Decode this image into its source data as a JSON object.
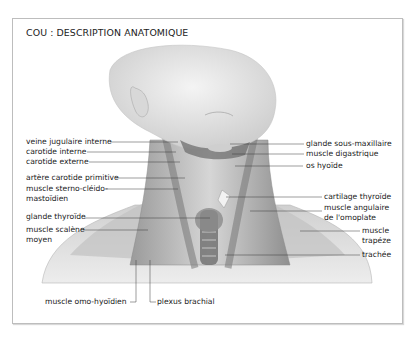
{
  "title": "COU : DESCRIPTION ANATOMIQUE",
  "labels_left": [
    {
      "id": "veine-jugulaire-interne",
      "text": "veine jugulaire interne"
    },
    {
      "id": "carotide-interne",
      "text": "carotide interne"
    },
    {
      "id": "carotide-externe",
      "text": "carotide externe"
    },
    {
      "id": "artere-carotide-primitive",
      "text": "artère carotide primitive"
    },
    {
      "id": "muscle-sterno-cleido-mastoidien",
      "line1": "muscle sterno-cléido-",
      "line2": "mastoïdien"
    },
    {
      "id": "glande-thyroide",
      "text": "glande thyroïde"
    },
    {
      "id": "muscle-scalene-moyen",
      "line1": "muscle scalène",
      "line2": "moyen"
    }
  ],
  "labels_right": [
    {
      "id": "glande-sous-maxillaire",
      "text": "glande sous-maxillaire"
    },
    {
      "id": "muscle-digastrique",
      "text": "muscle digastrique"
    },
    {
      "id": "os-hyoide",
      "text": "os hyoïde"
    },
    {
      "id": "cartilage-thyroide",
      "text": "cartilage thyroïde"
    },
    {
      "id": "muscle-angulaire-omoplate",
      "line1": "muscle angulaire",
      "line2": "de l'omoplate"
    },
    {
      "id": "muscle-trapeze",
      "line1": "muscle",
      "line2": "trapéze"
    },
    {
      "id": "trachee",
      "text": "trachée"
    }
  ],
  "labels_bottom": [
    {
      "id": "muscle-omo-hyoidien",
      "text": "muscle omo-hyoïdien"
    },
    {
      "id": "plexus-brachial",
      "text": "plexus brachial"
    }
  ]
}
